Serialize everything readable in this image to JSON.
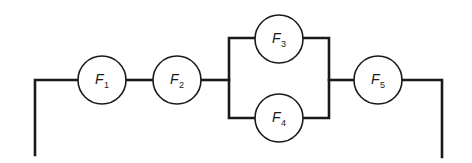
{
  "diagram": {
    "type": "reliability-block-diagram",
    "components": [
      {
        "id": "F1",
        "letter": "F",
        "subscript": "1",
        "cx": 102,
        "cy": 80
      },
      {
        "id": "F2",
        "letter": "F",
        "subscript": "2",
        "cx": 177,
        "cy": 80
      },
      {
        "id": "F3",
        "letter": "F",
        "subscript": "3",
        "cx": 279,
        "cy": 39
      },
      {
        "id": "F4",
        "letter": "F",
        "subscript": "4",
        "cx": 279,
        "cy": 118
      },
      {
        "id": "F5",
        "letter": "F",
        "subscript": "5",
        "cx": 378,
        "cy": 80
      }
    ],
    "radius": 24,
    "structure": {
      "series_1": [
        "F1",
        "F2"
      ],
      "parallel": [
        "F3",
        "F4"
      ],
      "series_2": [
        "F5"
      ]
    },
    "colors": {
      "line": "#1a1a1a",
      "background": "#ffffff"
    }
  }
}
